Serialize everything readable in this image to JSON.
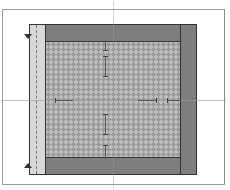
{
  "diagram": {
    "type": "layout-margins-diagram",
    "colors": {
      "frame_border": "#9a9a9a",
      "panel_border": "#333333",
      "margin_band": "#7e7e7e",
      "left_strip": "#d8d8d8",
      "content_pattern_bg": "#bdbdbd",
      "content_pattern_dot": "#9a9a9a",
      "dimension_line": "#555555"
    },
    "regions": [
      {
        "name": "top-margin"
      },
      {
        "name": "bottom-margin"
      },
      {
        "name": "right-margin"
      },
      {
        "name": "gutter-strip"
      },
      {
        "name": "content-area"
      }
    ],
    "dimension_markers": [
      {
        "orientation": "vertical",
        "position": "top-margin-arrow"
      },
      {
        "orientation": "vertical",
        "position": "top-inner-span"
      },
      {
        "orientation": "horizontal",
        "position": "left-inner-span"
      },
      {
        "orientation": "horizontal",
        "position": "right-inner-span"
      },
      {
        "orientation": "horizontal",
        "position": "right-margin-arrow"
      },
      {
        "orientation": "vertical",
        "position": "bottom-inner-span"
      },
      {
        "orientation": "vertical",
        "position": "bottom-margin-arrow"
      }
    ],
    "side_markers": [
      {
        "name": "top-left-triangle"
      },
      {
        "name": "bottom-left-triangle"
      }
    ]
  }
}
